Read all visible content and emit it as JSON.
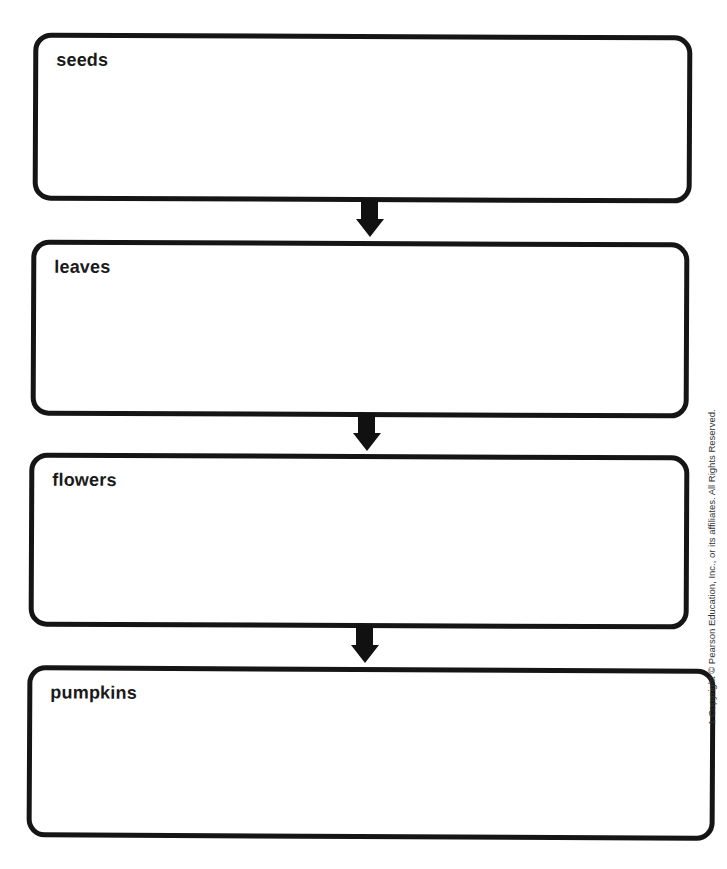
{
  "diagram": {
    "type": "flow-chart",
    "direction": "top-to-bottom",
    "boxes": [
      {
        "label": "seeds"
      },
      {
        "label": "leaves"
      },
      {
        "label": "flowers"
      },
      {
        "label": "pumpkins"
      }
    ],
    "connectors": [
      {
        "from": "seeds",
        "to": "leaves",
        "icon": "down-arrow-icon"
      },
      {
        "from": "leaves",
        "to": "flowers",
        "icon": "down-arrow-icon"
      },
      {
        "from": "flowers",
        "to": "pumpkins",
        "icon": "down-arrow-icon"
      }
    ],
    "colors": {
      "stroke": "#151515",
      "background": "#ffffff"
    }
  },
  "footer": {
    "copyright": "1 Copyright © Pearson Education, Inc., or its affiliates. All Rights Reserved."
  }
}
